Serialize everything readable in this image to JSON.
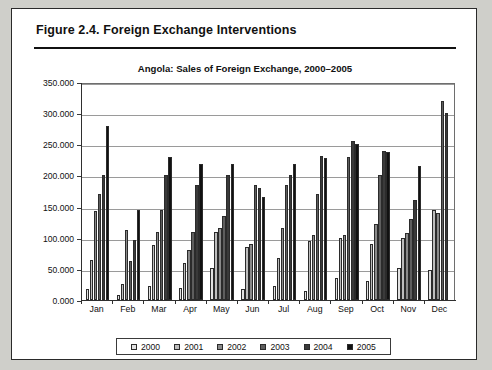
{
  "figure": {
    "label": "Figure 2.4.  Foreign Exchange Interventions"
  },
  "chart_data": {
    "type": "bar",
    "title": "Angola: Sales of Foreign Exchange, 2000–2005",
    "xlabel": "",
    "ylabel": "",
    "ylim": [
      0,
      350
    ],
    "ytick_labels": [
      "350.000",
      "300.000",
      "250.000",
      "200.000",
      "150.000",
      "100.000",
      "50.000",
      "0.000"
    ],
    "ytick_values": [
      350,
      300,
      250,
      200,
      150,
      100,
      50,
      0
    ],
    "grid": true,
    "legend_position": "bottom",
    "categories": [
      "Jan",
      "Feb",
      "Mar",
      "Apr",
      "May",
      "Jun",
      "Jul",
      "Aug",
      "Sep",
      "Oct",
      "Nov",
      "Dec"
    ],
    "series": [
      {
        "name": "2000",
        "color": "#e2e2e2",
        "values": [
          18,
          8,
          22,
          20,
          52,
          18,
          22,
          15,
          35,
          30,
          52,
          48
        ]
      },
      {
        "name": "2001",
        "color": "#bdbdbd",
        "values": [
          65,
          25,
          88,
          60,
          110,
          85,
          68,
          95,
          100,
          90,
          100,
          145
        ]
      },
      {
        "name": "2002",
        "color": "#8a8a8a",
        "values": [
          143,
          112,
          110,
          80,
          115,
          90,
          115,
          105,
          105,
          122,
          108,
          140
        ]
      },
      {
        "name": "2003",
        "color": "#5e5e5e",
        "values": [
          170,
          62,
          145,
          110,
          135,
          185,
          185,
          170,
          230,
          200,
          130,
          320
        ]
      },
      {
        "name": "2004",
        "color": "#3a3a3a",
        "values": [
          200,
          97,
          200,
          185,
          200,
          180,
          200,
          232,
          255,
          240,
          160,
          300
        ]
      },
      {
        "name": "2005",
        "color": "#111111",
        "values": [
          280,
          145,
          230,
          218,
          218,
          165,
          218,
          228,
          250,
          238,
          215,
          0
        ]
      }
    ]
  }
}
